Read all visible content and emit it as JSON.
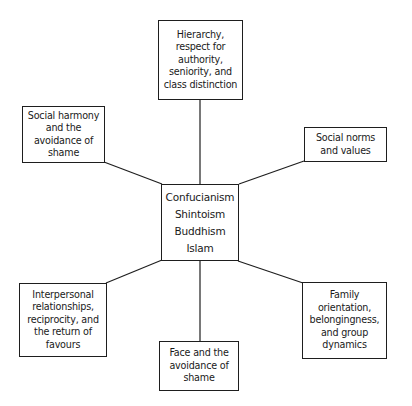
{
  "diagram": {
    "center": {
      "lines": [
        "Confucianism",
        "Shintoism",
        "Buddhism",
        "Islam"
      ]
    },
    "nodes": {
      "top": {
        "lines": [
          "Hierarchy,",
          "respect for",
          "authority,",
          "seniority, and",
          "class distinction"
        ]
      },
      "upper_left": {
        "lines": [
          "Social harmony",
          "and the",
          "avoidance of",
          "shame"
        ]
      },
      "upper_right": {
        "lines": [
          "Social norms",
          "and values"
        ]
      },
      "lower_left": {
        "lines": [
          "Interpersonal",
          "relationships,",
          "reciprocity, and",
          "the return of",
          "favours"
        ]
      },
      "bottom": {
        "lines": [
          "Face and the",
          "avoidance of",
          "shame"
        ]
      },
      "lower_right": {
        "lines": [
          "Family",
          "orientation,",
          "belongingness,",
          "and group",
          "dynamics"
        ]
      }
    },
    "colors": {
      "stroke": "#1e1e1e",
      "background": "#ffffff",
      "text": "#1a1a1a"
    }
  }
}
